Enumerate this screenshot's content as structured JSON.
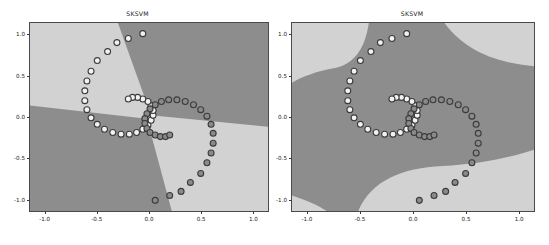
{
  "figure": {
    "background": "#ffffff",
    "width": 549,
    "height": 245,
    "panels": 2
  },
  "chart_data": [
    {
      "type": "scatter",
      "title": "SKSVM",
      "xlabel": "",
      "ylabel": "",
      "xlim": [
        -1.15,
        1.15
      ],
      "ylim": [
        -1.15,
        1.15
      ],
      "xticks": [
        "-1.0",
        "-0.5",
        "0.0",
        "0.5",
        "1.0"
      ],
      "xtick_values": [
        -1.0,
        -0.5,
        0.0,
        0.5,
        1.0
      ],
      "yticks": [
        "1.0",
        "0.5",
        "0.0",
        "-0.5",
        "-1.0"
      ],
      "ytick_values": [
        1.0,
        0.5,
        0.0,
        -0.5,
        -1.0
      ],
      "grid": false,
      "legend": "none",
      "decision_regions": {
        "description": "Four wedge-shaped regions meeting near the origin, alternating light and dark class shading (linear-like kernel)",
        "class_light_color": "#d2d2d2",
        "class_dark_color": "#8d8d8d",
        "boundary_type": "piecewise-linear-x-cross"
      },
      "marker": {
        "shape": "circle",
        "size": 3.0,
        "edge_color": "#3b3b3b"
      },
      "series": [
        {
          "name": "class-0",
          "marker_face_color": "#f2f2f2",
          "points": [
            [
              -0.06,
              1.02
            ],
            [
              -0.2,
              0.96
            ],
            [
              -0.31,
              0.91
            ],
            [
              -0.4,
              0.8
            ],
            [
              -0.5,
              0.69
            ],
            [
              -0.56,
              0.56
            ],
            [
              -0.6,
              0.44
            ],
            [
              -0.62,
              0.32
            ],
            [
              -0.62,
              0.2
            ],
            [
              -0.6,
              0.09
            ],
            [
              -0.56,
              -0.01
            ],
            [
              -0.5,
              -0.09
            ],
            [
              -0.43,
              -0.15
            ],
            [
              -0.35,
              -0.19
            ],
            [
              -0.27,
              -0.21
            ],
            [
              -0.19,
              -0.21
            ],
            [
              -0.12,
              -0.19
            ],
            [
              -0.06,
              -0.15
            ],
            [
              -0.01,
              -0.1
            ],
            [
              0.02,
              -0.04
            ],
            [
              0.04,
              0.02
            ],
            [
              0.04,
              0.08
            ],
            [
              0.02,
              0.14
            ],
            [
              -0.01,
              0.19
            ],
            [
              -0.06,
              0.22
            ],
            [
              -0.11,
              0.24
            ],
            [
              -0.16,
              0.24
            ],
            [
              -0.2,
              0.22
            ]
          ]
        },
        {
          "name": "class-1",
          "marker_face_color": "#8a8a8a",
          "points": [
            [
              0.06,
              -1.02
            ],
            [
              0.2,
              -0.96
            ],
            [
              0.31,
              -0.91
            ],
            [
              0.4,
              -0.8
            ],
            [
              0.5,
              -0.69
            ],
            [
              0.56,
              -0.56
            ],
            [
              0.6,
              -0.44
            ],
            [
              0.62,
              -0.32
            ],
            [
              0.62,
              -0.2
            ],
            [
              0.6,
              -0.09
            ],
            [
              0.56,
              0.01
            ],
            [
              0.5,
              0.09
            ],
            [
              0.43,
              0.15
            ],
            [
              0.35,
              0.19
            ],
            [
              0.27,
              0.21
            ],
            [
              0.19,
              0.21
            ],
            [
              0.12,
              0.19
            ],
            [
              0.06,
              0.15
            ],
            [
              0.01,
              0.1
            ],
            [
              -0.02,
              0.04
            ],
            [
              -0.04,
              -0.02
            ],
            [
              -0.04,
              -0.08
            ],
            [
              -0.02,
              -0.14
            ],
            [
              0.01,
              -0.19
            ],
            [
              0.06,
              -0.22
            ],
            [
              0.11,
              -0.24
            ],
            [
              0.16,
              -0.24
            ],
            [
              0.2,
              -0.22
            ]
          ]
        }
      ]
    },
    {
      "type": "scatter",
      "title": "SKSVM",
      "xlabel": "",
      "ylabel": "",
      "xlim": [
        -1.15,
        1.15
      ],
      "ylim": [
        -1.15,
        1.15
      ],
      "xticks": [
        "-1.0",
        "-0.5",
        "0.0",
        "0.5",
        "1.0"
      ],
      "xtick_values": [
        -1.0,
        -0.5,
        0.0,
        0.5,
        1.0
      ],
      "yticks": [
        "1.0",
        "0.5",
        "0.0",
        "-0.5",
        "-1.0"
      ],
      "ytick_values": [
        1.0,
        0.5,
        0.0,
        -0.5,
        -1.0
      ],
      "grid": false,
      "legend": "none",
      "decision_regions": {
        "description": "Large central dark band with light wedges in the upper-left and lower-right corners (nonlinear RBF-like boundary)",
        "class_light_color": "#d2d2d2",
        "class_dark_color": "#8d8d8d",
        "boundary_type": "curved-s-band"
      },
      "marker": {
        "shape": "circle",
        "size": 3.0,
        "edge_color": "#3b3b3b"
      },
      "series": [
        {
          "name": "class-0",
          "marker_face_color": "#f2f2f2",
          "points": [
            [
              -0.06,
              1.02
            ],
            [
              -0.2,
              0.96
            ],
            [
              -0.31,
              0.91
            ],
            [
              -0.4,
              0.8
            ],
            [
              -0.5,
              0.69
            ],
            [
              -0.56,
              0.56
            ],
            [
              -0.6,
              0.44
            ],
            [
              -0.62,
              0.32
            ],
            [
              -0.62,
              0.2
            ],
            [
              -0.6,
              0.09
            ],
            [
              -0.56,
              -0.01
            ],
            [
              -0.5,
              -0.09
            ],
            [
              -0.43,
              -0.15
            ],
            [
              -0.35,
              -0.19
            ],
            [
              -0.27,
              -0.21
            ],
            [
              -0.19,
              -0.21
            ],
            [
              -0.12,
              -0.19
            ],
            [
              -0.06,
              -0.15
            ],
            [
              -0.01,
              -0.1
            ],
            [
              0.02,
              -0.04
            ],
            [
              0.04,
              0.02
            ],
            [
              0.04,
              0.08
            ],
            [
              0.02,
              0.14
            ],
            [
              -0.01,
              0.19
            ],
            [
              -0.06,
              0.22
            ],
            [
              -0.11,
              0.24
            ],
            [
              -0.16,
              0.24
            ],
            [
              -0.2,
              0.22
            ]
          ]
        },
        {
          "name": "class-1",
          "marker_face_color": "#8a8a8a",
          "points": [
            [
              0.06,
              -1.02
            ],
            [
              0.2,
              -0.96
            ],
            [
              0.31,
              -0.91
            ],
            [
              0.4,
              -0.8
            ],
            [
              0.5,
              -0.69
            ],
            [
              0.56,
              -0.56
            ],
            [
              0.6,
              -0.44
            ],
            [
              0.62,
              -0.32
            ],
            [
              0.62,
              -0.2
            ],
            [
              0.6,
              -0.09
            ],
            [
              0.56,
              0.01
            ],
            [
              0.5,
              0.09
            ],
            [
              0.43,
              0.15
            ],
            [
              0.35,
              0.19
            ],
            [
              0.27,
              0.21
            ],
            [
              0.19,
              0.21
            ],
            [
              0.12,
              0.19
            ],
            [
              0.06,
              0.15
            ],
            [
              0.01,
              0.1
            ],
            [
              -0.02,
              0.04
            ],
            [
              -0.04,
              -0.02
            ],
            [
              -0.04,
              -0.08
            ],
            [
              -0.02,
              -0.14
            ],
            [
              0.01,
              -0.19
            ],
            [
              0.06,
              -0.22
            ],
            [
              0.11,
              -0.24
            ],
            [
              0.16,
              -0.24
            ],
            [
              0.2,
              -0.22
            ]
          ]
        }
      ]
    }
  ]
}
